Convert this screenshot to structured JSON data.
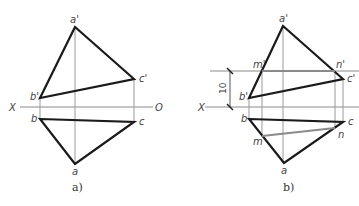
{
  "colors": {
    "outline": "#1a1a1a",
    "projection": "#9a9a9a",
    "construction": "#8a8a8a",
    "label": "#444444"
  },
  "panel_a": {
    "caption": "a)",
    "axis_start": "X",
    "axis_end": "O",
    "labels": {
      "a_prime": "a'",
      "b_prime": "b'",
      "c_prime": "c'",
      "a": "a",
      "b": "b",
      "c": "c"
    }
  },
  "panel_b": {
    "caption": "b)",
    "axis_start": "X",
    "dimension": "10",
    "labels": {
      "a_prime": "a'",
      "b_prime": "b'",
      "c_prime": "c'",
      "m_prime": "m'",
      "n_prime": "n'",
      "a": "a",
      "b": "b",
      "c": "c",
      "m": "m",
      "n": "n"
    }
  }
}
